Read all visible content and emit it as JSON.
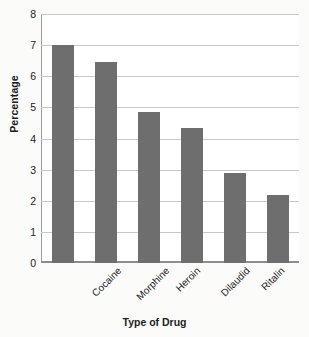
{
  "chart_data": {
    "type": "bar",
    "title": "",
    "xlabel": "Type of Drug",
    "ylabel": "Percentage",
    "categories": [
      "Cocaine",
      "Morphine",
      "Heroin",
      "Dilaudid",
      "Ritalin",
      "Speedball"
    ],
    "values": [
      7.0,
      6.45,
      4.85,
      4.35,
      2.9,
      2.2
    ],
    "ylim": [
      0,
      8
    ],
    "ytick_labels": [
      "0",
      "1",
      "2",
      "3",
      "4",
      "5",
      "6",
      "7",
      "8"
    ],
    "ytick_values": [
      0,
      1,
      2,
      3,
      4,
      5,
      6,
      7,
      8
    ],
    "grid": true,
    "legend": false,
    "legend_position": "none",
    "bar_color": "#6e6e6e",
    "grid_color": "#c9c9c9",
    "axis_color": "#8d8d8d",
    "background_color": "#fbfbfa",
    "plot_background_color": "#ffffff",
    "xtick_rotation": -45
  }
}
